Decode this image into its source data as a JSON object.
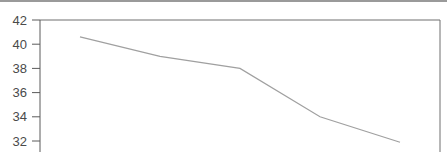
{
  "chart_data": {
    "type": "line",
    "title": "",
    "xlabel": "",
    "ylabel": "",
    "ylim": [
      31,
      42
    ],
    "grid": false,
    "legend": null,
    "yticks": [
      42,
      40,
      38,
      36,
      34,
      32
    ],
    "ytick_labels": [
      "42",
      "40",
      "38",
      "36",
      "34",
      "32"
    ],
    "x": [
      1,
      2,
      3,
      4,
      5
    ],
    "series": [
      {
        "name": "series-1",
        "values": [
          40.6,
          39.0,
          38.0,
          34.0,
          31.9
        ],
        "color": "#a0a0a0"
      }
    ]
  },
  "style": {
    "axis_color": "#5a5a5a",
    "frame_color": "#6e6e6e",
    "line_color": "#a0a0a0"
  }
}
